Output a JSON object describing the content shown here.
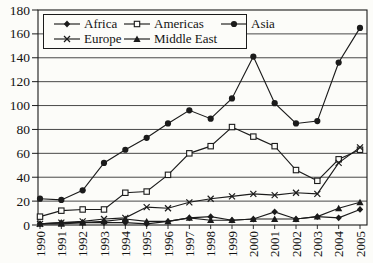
{
  "chart_data": {
    "type": "line",
    "title": "",
    "categories": [
      "1990",
      "1991",
      "1992",
      "1993",
      "1994",
      "1995",
      "1996",
      "1997",
      "1998",
      "1999",
      "2000",
      "2001",
      "2002",
      "2003",
      "2004",
      "2005"
    ],
    "series": [
      {
        "name": "Africa",
        "marker": "diamond-filled",
        "values": [
          1,
          2,
          2,
          2,
          2,
          1,
          3,
          6,
          7,
          4,
          5,
          11,
          5,
          7,
          6,
          13
        ]
      },
      {
        "name": "Americas",
        "marker": "square-open",
        "values": [
          7,
          12,
          13,
          13,
          27,
          28,
          42,
          60,
          66,
          82,
          74,
          66,
          46,
          37,
          55,
          63
        ]
      },
      {
        "name": "Asia",
        "marker": "circle-filled",
        "values": [
          22,
          21,
          29,
          52,
          63,
          73,
          85,
          96,
          89,
          106,
          141,
          102,
          85,
          87,
          136,
          165
        ]
      },
      {
        "name": "Europe",
        "marker": "x",
        "values": [
          1,
          2,
          3,
          5,
          6,
          15,
          14,
          19,
          22,
          24,
          26,
          25,
          27,
          26,
          52,
          65
        ]
      },
      {
        "name": "Middle East",
        "marker": "triangle-filled",
        "values": [
          1,
          1,
          2,
          3,
          5,
          3,
          3,
          6,
          4,
          4,
          5,
          5,
          5,
          7,
          14,
          19
        ]
      }
    ],
    "ylim": [
      0,
      180
    ],
    "ytick_step": 20,
    "y_ticks": [
      "0",
      "20",
      "40",
      "60",
      "80",
      "100",
      "120",
      "140",
      "160",
      "180"
    ],
    "grid": "horizontal",
    "legend_position": "top-left-inside",
    "line_color": "#1b1b1b",
    "label_color": "#131313",
    "background_color": "#fcfcf9"
  }
}
